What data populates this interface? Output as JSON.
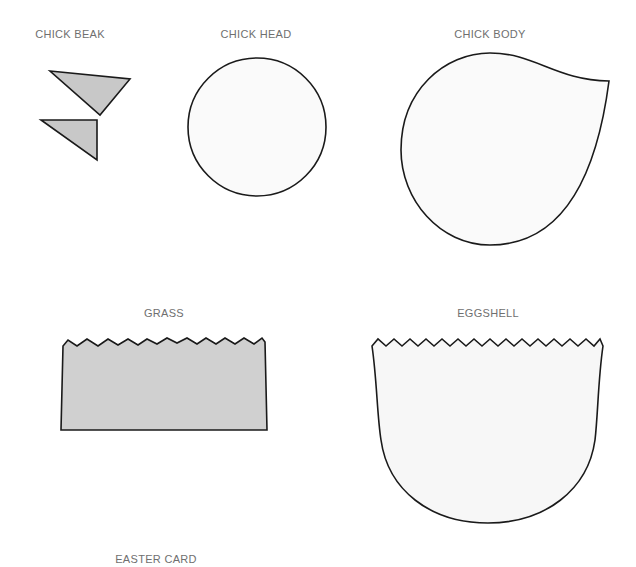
{
  "templates": [
    {
      "id": "beak",
      "label": "CHICK BEAK",
      "fill": "#c8c8c8"
    },
    {
      "id": "head",
      "label": "CHICK HEAD",
      "fill": "#fafafa"
    },
    {
      "id": "body",
      "label": "CHICK BODY",
      "fill": "#fafafa"
    },
    {
      "id": "grass",
      "label": "GRASS",
      "fill": "#d0d0d0"
    },
    {
      "id": "eggshell",
      "label": "EGGSHELL",
      "fill": "#f7f7f7"
    }
  ],
  "footer": {
    "title": "EASTER CARD"
  },
  "colors": {
    "outline": "#1a1a1a",
    "label": "#6f6f6f",
    "background": "#ffffff"
  }
}
